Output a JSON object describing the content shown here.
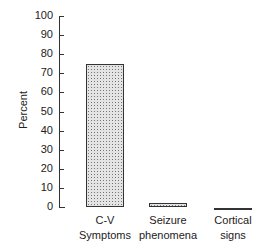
{
  "chart_data": {
    "type": "bar",
    "title": "",
    "xlabel": "",
    "ylabel": "Percent",
    "ylim": [
      0,
      100
    ],
    "yticks": [
      0,
      10,
      20,
      30,
      40,
      50,
      60,
      70,
      80,
      90,
      100
    ],
    "categories": [
      "C-V Symptoms",
      "Seizure phenomena",
      "Cortical signs"
    ],
    "category_lines": [
      [
        "C-V",
        "Symptoms"
      ],
      [
        "Seizure",
        "phenomena"
      ],
      [
        "Cortical",
        "signs"
      ]
    ],
    "values": [
      75,
      2,
      0
    ],
    "grid": false
  }
}
